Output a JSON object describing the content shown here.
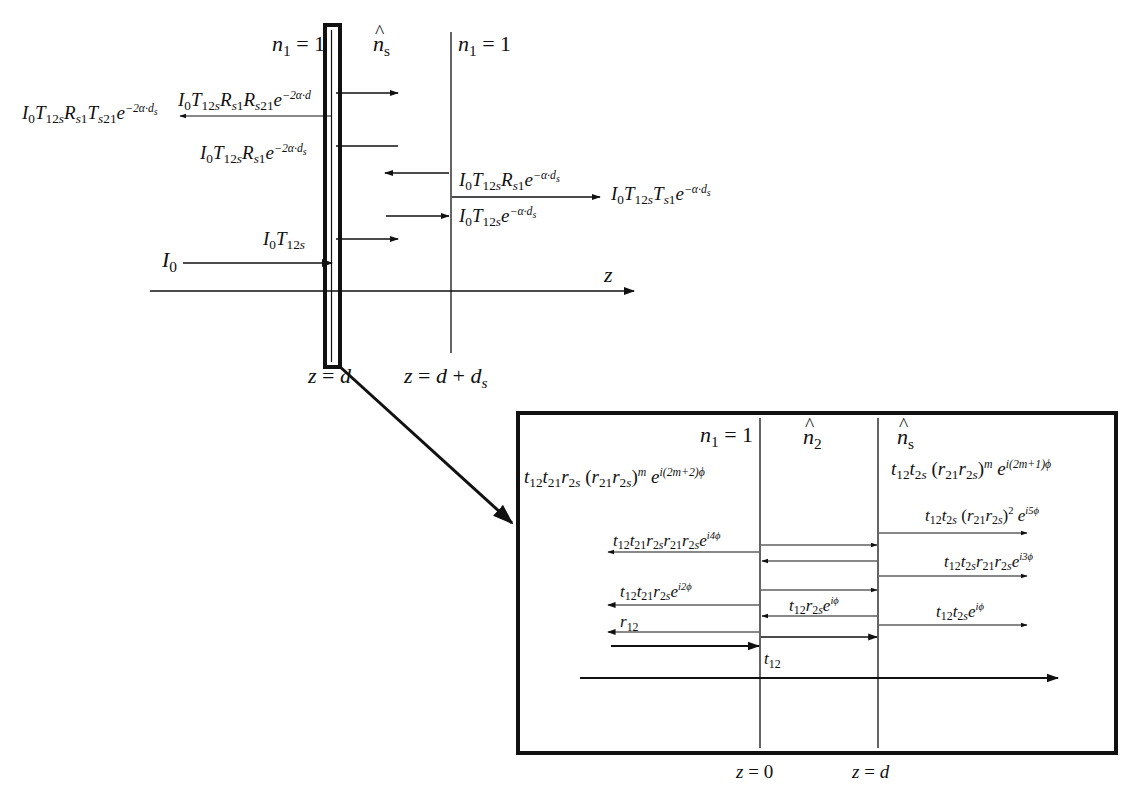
{
  "figure": {
    "type": "thin-film multiple reflection diagram",
    "top_panel": {
      "medium_left": "n₁ = 1",
      "medium_middle": "n̂ₛ",
      "medium_right": "n₁ = 1",
      "axis_label": "z",
      "boundary_left": "z = d",
      "boundary_right": "z = d + dₛ",
      "labels": {
        "incident": "I₀",
        "transmitted_first": "I₀T₁₂ₛ",
        "reflected_sample_left": "I₀T₁₂ₛRₛ₁e^(−2α·dₛ)",
        "transmitted_back": "I₀T₁₂ₛRₛ₁Tₛ₂₁e^(−2α·dₛ)",
        "reflected_second": "I₀T₁₂ₛRₛ₁Rₛ₂₁e^(−2α·d)",
        "reflected_right": "I₀T₁₂ₛRₛ₁e^(−α·dₛ)",
        "arriving_right": "I₀T₁₂ₛe^(−α·dₛ)",
        "transmitted_out": "I₀T₁₂ₛTₛ₁e^(−α·dₛ)"
      }
    },
    "inset_panel": {
      "medium_left": "n₁ = 1",
      "medium_middle": "n̂₂",
      "medium_right": "n̂ₛ",
      "boundary_left": "z = 0",
      "boundary_right": "z = d",
      "labels": {
        "general_reflected": "t₁₂t₂₁r₂ₛ(r₂₁r₂ₛ)^m e^(i(2m+2)φ)",
        "general_transmitted": "t₁₂t₂ₛ(r₂₁r₂ₛ)^m e^(i(2m+1)φ)",
        "transmitted_5": "t₁₂t₂ₛ(r₂₁r₂ₛ)² e^(i5φ)",
        "reflected_4": "t₁₂t₂₁r₂ₛr₂₁r₂ₛe^(i4φ)",
        "transmitted_3": "t₁₂t₂ₛr₂₁r₂ₛe^(i3φ)",
        "reflected_2": "t₁₂t₂₁r₂ₛe^(i2φ)",
        "internal_1": "t₁₂r₂ₛe^(iφ)",
        "transmitted_1": "t₁₂t₂ₛe^(iφ)",
        "reflected_0": "r₁₂",
        "transmitted_0": "t₁₂"
      }
    },
    "colors": {
      "ink": "#111111",
      "background": "#ffffff"
    }
  }
}
